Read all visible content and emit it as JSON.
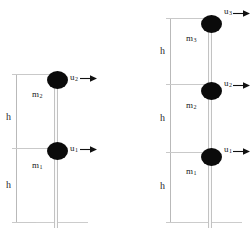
{
  "figure": {
    "background_color": "#ffffff",
    "mass_color": "#0b0b0b",
    "rod_color": "#c2c2c2",
    "dimension_line_color": "#b9b9b9",
    "text_color": "#1a1a1a"
  },
  "panels": [
    {
      "id": "left-panel",
      "name": "two-mass-system",
      "mass_count": 2,
      "height_label_count": 2,
      "masses": [
        {
          "id": "left-mass-upper",
          "mass_label": "m",
          "mass_subscript": "2",
          "velocity_label": "u",
          "velocity_subscript": "2",
          "arrow_direction": "right"
        },
        {
          "id": "left-mass-lower",
          "mass_label": "m",
          "mass_subscript": "1",
          "velocity_label": "u",
          "velocity_subscript": "1",
          "arrow_direction": "right"
        }
      ],
      "heights": [
        {
          "id": "left-h-upper",
          "label": "h"
        },
        {
          "id": "left-h-lower",
          "label": "h"
        }
      ]
    },
    {
      "id": "right-panel",
      "name": "three-mass-system",
      "mass_count": 3,
      "height_label_count": 3,
      "masses": [
        {
          "id": "right-mass-top",
          "mass_label": "m",
          "mass_subscript": "3",
          "velocity_label": "u",
          "velocity_subscript": "3",
          "arrow_direction": "right"
        },
        {
          "id": "right-mass-middle",
          "mass_label": "m",
          "mass_subscript": "2",
          "velocity_label": "u",
          "velocity_subscript": "2",
          "arrow_direction": "right"
        },
        {
          "id": "right-mass-bottom",
          "mass_label": "m",
          "mass_subscript": "1",
          "velocity_label": "u",
          "velocity_subscript": "1",
          "arrow_direction": "right"
        }
      ],
      "heights": [
        {
          "id": "right-h-top",
          "label": "h"
        },
        {
          "id": "right-h-middle",
          "label": "h"
        },
        {
          "id": "right-h-bottom",
          "label": "h"
        }
      ]
    }
  ]
}
